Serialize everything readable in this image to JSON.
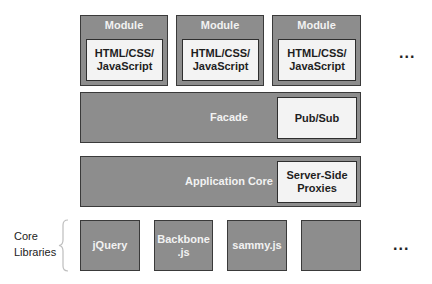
{
  "modules": [
    {
      "title": "Module",
      "content": [
        "HTML/CSS/",
        "JavaScript"
      ]
    },
    {
      "title": "Module",
      "content": [
        "HTML/CSS/",
        "JavaScript"
      ]
    },
    {
      "title": "Module",
      "content": [
        "HTML/CSS/",
        "JavaScript"
      ]
    }
  ],
  "modules_more": "...",
  "facade": {
    "label": "Facade",
    "inner": "Pub/Sub"
  },
  "app_core": {
    "label": "Application Core",
    "inner": [
      "Server-Side",
      "Proxies"
    ]
  },
  "core_libraries": {
    "label": [
      "Core",
      "Libraries"
    ],
    "items": [
      {
        "label": [
          "jQuery"
        ]
      },
      {
        "label": [
          "Backbone",
          ".js"
        ]
      },
      {
        "label": [
          "sammy.js"
        ]
      },
      {
        "label": []
      }
    ],
    "more": "..."
  },
  "colors": {
    "layer_fill": "#8d8d8d",
    "inner_fill": "#f3f3f3",
    "border": "#3a3a3a"
  }
}
